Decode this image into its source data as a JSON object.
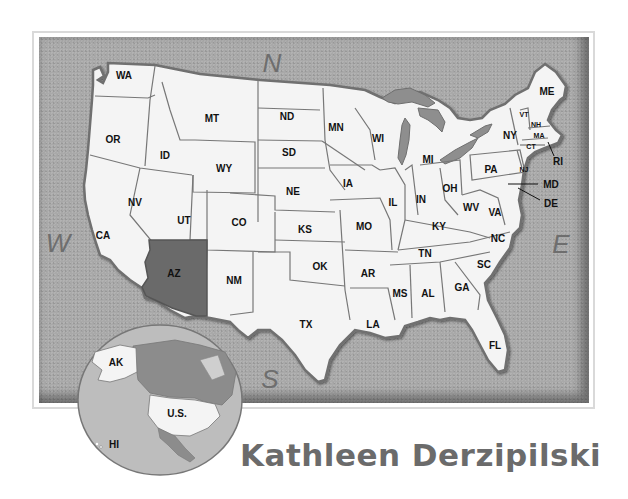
{
  "map": {
    "title": "United States map",
    "highlighted_state": "AZ",
    "colors": {
      "ocean": "#a9a9a9",
      "land": "#f4f4f4",
      "highlight": "#6a6a6a",
      "lakes": "#8e8e8e",
      "border": "#6f6f6f",
      "author_text": "#6b6b6b"
    },
    "compass": {
      "north": "N",
      "south": "S",
      "east": "E",
      "west": "W"
    },
    "states": [
      {
        "abbr": "WA",
        "x": 124,
        "y": 75
      },
      {
        "abbr": "OR",
        "x": 113,
        "y": 139
      },
      {
        "abbr": "ID",
        "x": 165,
        "y": 155
      },
      {
        "abbr": "MT",
        "x": 212,
        "y": 118
      },
      {
        "abbr": "WY",
        "x": 224,
        "y": 168
      },
      {
        "abbr": "ND",
        "x": 287,
        "y": 116
      },
      {
        "abbr": "SD",
        "x": 289,
        "y": 152
      },
      {
        "abbr": "NE",
        "x": 293,
        "y": 191
      },
      {
        "abbr": "KS",
        "x": 305,
        "y": 229
      },
      {
        "abbr": "NV",
        "x": 135,
        "y": 202
      },
      {
        "abbr": "UT",
        "x": 184,
        "y": 220
      },
      {
        "abbr": "CO",
        "x": 239,
        "y": 222
      },
      {
        "abbr": "CA",
        "x": 103,
        "y": 235
      },
      {
        "abbr": "AZ",
        "x": 174,
        "y": 273
      },
      {
        "abbr": "NM",
        "x": 234,
        "y": 280
      },
      {
        "abbr": "OK",
        "x": 320,
        "y": 266
      },
      {
        "abbr": "TX",
        "x": 306,
        "y": 324
      },
      {
        "abbr": "MN",
        "x": 336,
        "y": 127
      },
      {
        "abbr": "IA",
        "x": 348,
        "y": 183
      },
      {
        "abbr": "MO",
        "x": 364,
        "y": 226
      },
      {
        "abbr": "AR",
        "x": 368,
        "y": 273
      },
      {
        "abbr": "LA",
        "x": 373,
        "y": 324
      },
      {
        "abbr": "WI",
        "x": 378,
        "y": 138
      },
      {
        "abbr": "IL",
        "x": 393,
        "y": 202
      },
      {
        "abbr": "MS",
        "x": 400,
        "y": 293
      },
      {
        "abbr": "MI",
        "x": 428,
        "y": 159
      },
      {
        "abbr": "IN",
        "x": 421,
        "y": 199
      },
      {
        "abbr": "KY",
        "x": 439,
        "y": 226
      },
      {
        "abbr": "TN",
        "x": 425,
        "y": 253
      },
      {
        "abbr": "AL",
        "x": 428,
        "y": 293
      },
      {
        "abbr": "OH",
        "x": 450,
        "y": 188
      },
      {
        "abbr": "WV",
        "x": 471,
        "y": 207
      },
      {
        "abbr": "VA",
        "x": 495,
        "y": 212
      },
      {
        "abbr": "NC",
        "x": 498,
        "y": 238
      },
      {
        "abbr": "SC",
        "x": 484,
        "y": 264
      },
      {
        "abbr": "GA",
        "x": 462,
        "y": 287
      },
      {
        "abbr": "FL",
        "x": 495,
        "y": 345
      },
      {
        "abbr": "PA",
        "x": 491,
        "y": 169
      },
      {
        "abbr": "NY",
        "x": 510,
        "y": 135
      },
      {
        "abbr": "ME",
        "x": 547,
        "y": 91
      },
      {
        "abbr": "VT",
        "x": 524,
        "y": 113
      },
      {
        "abbr": "NH",
        "x": 536,
        "y": 123
      },
      {
        "abbr": "MA",
        "x": 539,
        "y": 134
      },
      {
        "abbr": "CT",
        "x": 531,
        "y": 145
      },
      {
        "abbr": "NJ",
        "x": 524,
        "y": 168
      },
      {
        "abbr": "RI",
        "x": 558,
        "y": 161
      },
      {
        "abbr": "MD",
        "x": 551,
        "y": 184
      },
      {
        "abbr": "DE",
        "x": 551,
        "y": 203
      }
    ],
    "inset": {
      "labels": [
        {
          "text": "AK",
          "x": 116,
          "y": 366
        },
        {
          "text": "U.S.",
          "x": 177,
          "y": 417
        },
        {
          "text": "HI",
          "x": 114,
          "y": 448
        }
      ]
    }
  },
  "author": {
    "name": "Kathleen Derzipilski"
  }
}
